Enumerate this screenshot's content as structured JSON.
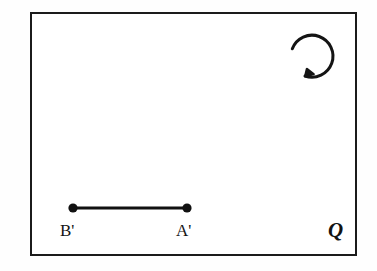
{
  "figure": {
    "background_color": "#fefefe",
    "stroke_color": "#1b1b1b",
    "plane": {
      "name": "plane-q",
      "label": "Q",
      "label_style": "bold-italic-serif",
      "border_color": "#1b1b1b",
      "border_width_px": 2,
      "fill_color": "#ffffff",
      "x": 30,
      "y": 12,
      "width": 327,
      "height": 244
    },
    "segment": {
      "name": "segment-a-prime-b-prime",
      "stroke_color": "#111111",
      "stroke_width_px": 3,
      "endpoints": [
        {
          "label": "B'",
          "cx": 73,
          "cy": 208,
          "dot_radius_px": 4.5
        },
        {
          "label": "A'",
          "cx": 187,
          "cy": 208,
          "dot_radius_px": 4.5
        }
      ]
    },
    "labels": {
      "b_prime": "B'",
      "a_prime": "A'",
      "plane": "Q"
    },
    "rotation_arrow": {
      "name": "clockwise-rotation-arrow",
      "direction": "clockwise",
      "center_x": 312,
      "center_y": 55,
      "radius_px": 21,
      "start_angle_deg": 195,
      "sweep_deg": 300,
      "stroke_color": "#141414",
      "stroke_width_px": 3
    }
  }
}
